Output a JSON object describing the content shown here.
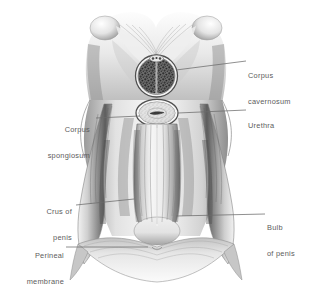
{
  "figure": {
    "style": "monochrome anatomical wash drawing",
    "background_color": "#ffffff",
    "ink_color": "#4a4a4a",
    "label_text_color": "#5c5c5c",
    "leader_line_color": "#6b6b6b"
  },
  "labels": [
    {
      "id": "corpus-cavernosum",
      "line1": "Corpus",
      "line2": "cavernosum",
      "side": "right",
      "x": 248,
      "y": 57
    },
    {
      "id": "urethra",
      "line1": "Urethra",
      "line2": "",
      "side": "right",
      "x": 248,
      "y": 105
    },
    {
      "id": "bulb-of-penis",
      "line1": "Bulb",
      "line2": "of penis",
      "side": "right",
      "x": 267,
      "y": 209
    },
    {
      "id": "corpus-spongiosum",
      "line1": "Corpus",
      "line2": "spongiosum",
      "side": "left",
      "x": 22,
      "y": 111
    },
    {
      "id": "crus-of-penis",
      "line1": "Crus of",
      "line2": "penis",
      "side": "left",
      "x": 22,
      "y": 193
    },
    {
      "id": "perineal-membrane",
      "line1": "Perineal",
      "line2": "membrane",
      "side": "left",
      "x": 12,
      "y": 237
    }
  ],
  "structures": [
    {
      "id": "pubic-arch",
      "name": "pubic arch"
    },
    {
      "id": "suspensory-ligament",
      "name": "suspensory ligament"
    },
    {
      "id": "corpus-cavernosum-section",
      "name": "corpus cavernosum cross-section"
    },
    {
      "id": "corpus-spongiosum-section",
      "name": "corpus spongiosum cross-section"
    },
    {
      "id": "urethra-lumen",
      "name": "urethral lumen"
    },
    {
      "id": "bulb-of-penis-body",
      "name": "bulb of penis"
    },
    {
      "id": "left-crus",
      "name": "left crus of penis"
    },
    {
      "id": "right-crus",
      "name": "right crus of penis"
    },
    {
      "id": "perineal-membrane-sheet",
      "name": "perineal membrane"
    }
  ]
}
